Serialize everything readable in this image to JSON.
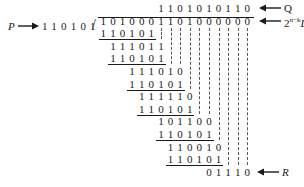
{
  "diagram": {
    "divisor": {
      "label": "P",
      "bits": "110101"
    },
    "quotient": {
      "label": "Q",
      "bits": "1101010110",
      "start_col": 6
    },
    "dividend": {
      "label_base": "2",
      "label_sup": "n−k",
      "label_var": "D",
      "bits": "1010001101000000",
      "start_col": 0
    },
    "remainder": {
      "label": "R",
      "bits": "01110",
      "start_col": 11
    },
    "steps": [
      {
        "bits": "110101",
        "start_col": 0,
        "underline": true
      },
      {
        "bits": "111011",
        "start_col": 1,
        "underline": false
      },
      {
        "bits": "110101",
        "start_col": 1,
        "underline": true
      },
      {
        "bits": "111010",
        "start_col": 3,
        "underline": false
      },
      {
        "bits": "110101",
        "start_col": 3,
        "underline": true
      },
      {
        "bits": "111110",
        "start_col": 4,
        "underline": false
      },
      {
        "bits": "110101",
        "start_col": 4,
        "underline": true
      },
      {
        "bits": "101100",
        "start_col": 6,
        "underline": false
      },
      {
        "bits": "110101",
        "start_col": 6,
        "underline": true
      },
      {
        "bits": "110010",
        "start_col": 7,
        "underline": false
      },
      {
        "bits": "110101",
        "start_col": 7,
        "underline": true
      }
    ]
  }
}
